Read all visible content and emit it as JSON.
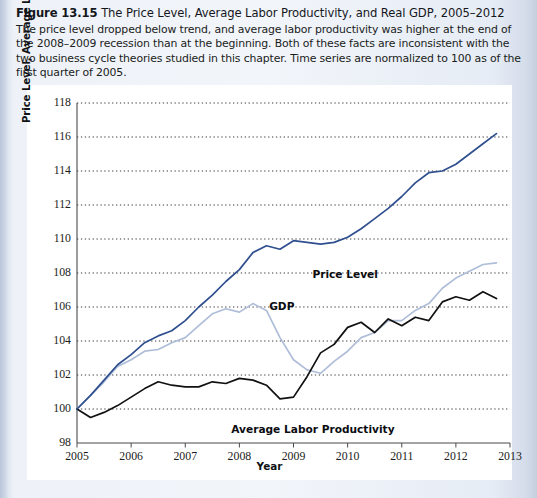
{
  "figure": {
    "number": "Figure 13.15",
    "title": "The Price Level, Average Labor Productivity, and Real GDP, 2005–2012",
    "description": "The price level dropped below trend, and average labor productivity was higher at the end of the 2008–2009 recession than at the beginning. Both of these facts are inconsistent with the two business cycle theories studied in this chapter. Time series are normalized to 100 as of the first quarter of 2005."
  },
  "labels": {
    "price_level": "Price Level",
    "gdp": "GDP",
    "labor_productivity": "Average Labor Productivity"
  },
  "colors": {
    "price_level": "#2f4f8f",
    "gdp": "#aebdd8",
    "labor_productivity": "#111111",
    "gridline": "#3a3a3a",
    "axis": "#4a4a4a",
    "panel_background": "#ffffff",
    "frame_background": "#e9eef6"
  },
  "chart_data": {
    "type": "line",
    "title": "The Price Level, Average Labor Productivity, and Real GDP, 2005–2012",
    "xlabel": "Year",
    "ylabel": "Price Level, Average Labor Productivity, 2005Q1 = 100",
    "xlim": [
      2005,
      2013
    ],
    "ylim": [
      98,
      118
    ],
    "yticks": [
      98,
      100,
      102,
      104,
      106,
      108,
      110,
      112,
      114,
      116,
      118
    ],
    "xticks": [
      2005,
      2006,
      2007,
      2008,
      2009,
      2010,
      2011,
      2012,
      2013
    ],
    "grid": "horizontal-dotted",
    "legend": "inline-annotations",
    "x": [
      2005.0,
      2005.25,
      2005.5,
      2005.75,
      2006.0,
      2006.25,
      2006.5,
      2006.75,
      2007.0,
      2007.25,
      2007.5,
      2007.75,
      2008.0,
      2008.25,
      2008.5,
      2008.75,
      2009.0,
      2009.25,
      2009.5,
      2009.75,
      2010.0,
      2010.25,
      2010.5,
      2010.75,
      2011.0,
      2011.25,
      2011.5,
      2011.75,
      2012.0,
      2012.25,
      2012.5,
      2012.75
    ],
    "series": [
      {
        "name": "Price Level",
        "color": "#2f4f8f",
        "values": [
          100.0,
          100.8,
          101.7,
          102.6,
          103.2,
          103.9,
          104.3,
          104.6,
          105.2,
          106.0,
          106.7,
          107.5,
          108.2,
          109.2,
          109.6,
          109.4,
          109.9,
          109.8,
          109.7,
          109.8,
          110.1,
          110.6,
          111.2,
          111.8,
          112.5,
          113.3,
          113.9,
          114.0,
          114.4,
          115.0,
          115.6,
          116.2
        ]
      },
      {
        "name": "GDP",
        "color": "#aebdd8",
        "values": [
          100.0,
          100.8,
          101.6,
          102.5,
          102.9,
          103.4,
          103.5,
          103.9,
          104.2,
          104.9,
          105.6,
          105.9,
          105.7,
          106.2,
          105.8,
          104.2,
          102.9,
          102.3,
          102.1,
          102.8,
          103.4,
          104.2,
          104.5,
          105.2,
          105.2,
          105.8,
          106.2,
          107.1,
          107.7,
          108.1,
          108.5,
          108.6
        ]
      },
      {
        "name": "Average Labor Productivity",
        "color": "#111111",
        "values": [
          100.0,
          99.5,
          99.8,
          100.2,
          100.7,
          101.2,
          101.6,
          101.4,
          101.3,
          101.3,
          101.6,
          101.5,
          101.8,
          101.7,
          101.4,
          100.6,
          100.7,
          101.9,
          103.3,
          103.8,
          104.8,
          105.1,
          104.5,
          105.3,
          104.9,
          105.4,
          105.2,
          106.3,
          106.6,
          106.4,
          106.9,
          106.5
        ]
      }
    ]
  }
}
